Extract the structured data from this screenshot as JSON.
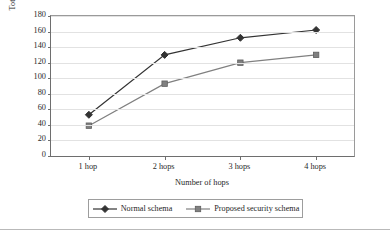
{
  "chart_data": {
    "type": "line",
    "title": "",
    "xlabel": "Number of hops",
    "ylabel": "Total network consumed energy (J)",
    "categories": [
      "1 hop",
      "2 hops",
      "3 hops",
      "4 hops"
    ],
    "ylim": [
      0,
      180
    ],
    "ytick_step": 20,
    "yticks": [
      180,
      160,
      140,
      120,
      100,
      80,
      60,
      40,
      20,
      0
    ],
    "grid": "horizontal",
    "legend_position": "bottom-center",
    "series": [
      {
        "name": "Normal schema",
        "marker": "diamond",
        "color": "#333333",
        "values": [
          53,
          130,
          152,
          162
        ]
      },
      {
        "name": "Proposed security schema",
        "marker": "square",
        "color": "#808080",
        "values": [
          39,
          93,
          120,
          130
        ]
      }
    ]
  },
  "axes": {
    "y_title": "Total network consumed energy (J)",
    "x_title": "Number of hops"
  },
  "legend": {
    "entries": [
      {
        "label": "Normal schema",
        "marker": "diamond-marker-icon"
      },
      {
        "label": "Proposed security schema",
        "marker": "square-marker-icon"
      }
    ]
  }
}
